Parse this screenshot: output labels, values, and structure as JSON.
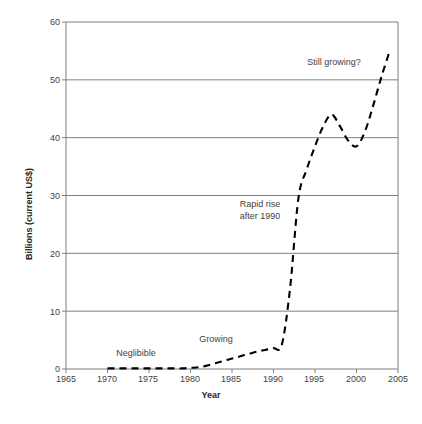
{
  "chart_data": {
    "type": "line",
    "title": "",
    "subtitle": "",
    "xlabel": "Year",
    "ylabel": "Billions (current US$)",
    "xlim": [
      1965,
      2005
    ],
    "ylim": [
      0,
      60
    ],
    "xticks": [
      1965,
      1970,
      1975,
      1980,
      1985,
      1990,
      1995,
      2000,
      2005
    ],
    "yticks": [
      0,
      10,
      20,
      30,
      40,
      50,
      60
    ],
    "grid": "horizontal",
    "legend": "none",
    "line_style": "dashed",
    "line_color": "#000000",
    "markers": "none",
    "x": [
      1970,
      1971,
      1972,
      1973,
      1974,
      1975,
      1976,
      1977,
      1978,
      1979,
      1980,
      1981,
      1982,
      1983,
      1984,
      1985,
      1986,
      1987,
      1988,
      1989,
      1990,
      1991,
      1992,
      1993,
      1994,
      1995,
      1996,
      1997,
      1998,
      1999,
      2000,
      2001,
      2002,
      2003,
      2004
    ],
    "values": [
      0.1,
      0.1,
      0.1,
      0.1,
      0.1,
      0.1,
      0.1,
      0.1,
      0.1,
      0.1,
      0.2,
      0.3,
      0.6,
      1.0,
      1.4,
      1.8,
      2.2,
      2.6,
      3.0,
      3.3,
      3.6,
      4.2,
      14.0,
      29.5,
      34.5,
      38.5,
      42.0,
      44.0,
      42.0,
      39.5,
      38.5,
      41.0,
      45.5,
      50.5,
      55.0
    ],
    "annotations": [
      {
        "text": "Neglibible",
        "x": 1974.2,
        "y": 2.4
      },
      {
        "text": "Growing",
        "x": 1984.0,
        "y": 4.7
      },
      {
        "text": "Rapid rise",
        "x": 1991.2,
        "y": 29.7
      },
      {
        "text": "after 1990",
        "x": 1991.2,
        "y": 27.5
      },
      {
        "text": "Still growing?",
        "x": 2000.2,
        "y": 52.0
      }
    ]
  },
  "axis": {
    "y_title": "Billions (current US$)",
    "x_title": "Year",
    "y_tick_labels": [
      "60",
      "50",
      "40",
      "30",
      "20",
      "10",
      "0"
    ],
    "x_tick_labels": [
      "1965",
      "1970",
      "1975",
      "1980",
      "1985",
      "1990",
      "1995",
      "2000",
      "2005"
    ]
  },
  "annotations": {
    "negligible": "Neglibible",
    "growing": "Growing",
    "rapid_rise_line1": "Rapid rise",
    "rapid_rise_line2": "after 1990",
    "still_growing": "Still growing?"
  },
  "colors": {
    "background": "#ffffff",
    "axis": "#808080",
    "grid": "#808080",
    "series": "#000000",
    "text": "#3f3f3f"
  }
}
